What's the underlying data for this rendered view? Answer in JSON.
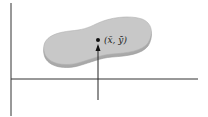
{
  "diagram": {
    "centroid_label": "(x̄, ȳ)",
    "shape_fill": "#c8c8c8",
    "shape_edge": "#a9a9a9",
    "axis_color": "#333333"
  }
}
